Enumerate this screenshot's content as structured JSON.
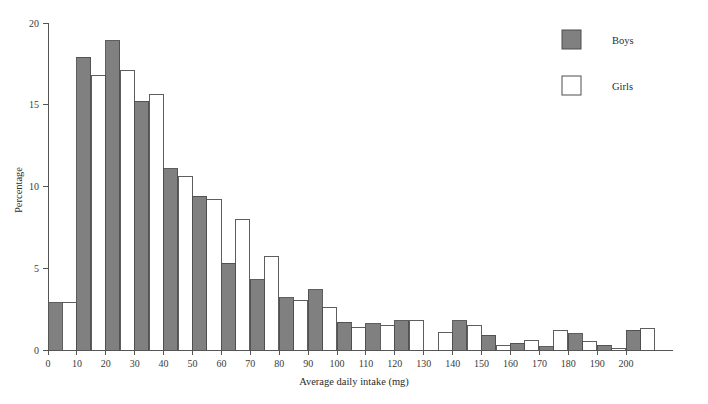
{
  "chart_data": {
    "type": "bar",
    "title": "",
    "xlabel": "Average daily intake (mg)",
    "ylabel": "Percentage",
    "xlim": [
      0,
      210
    ],
    "ylim": [
      0,
      20
    ],
    "xticks": [
      0,
      10,
      20,
      30,
      40,
      50,
      60,
      70,
      80,
      90,
      100,
      110,
      120,
      130,
      140,
      150,
      160,
      170,
      180,
      190,
      200
    ],
    "yticks": [
      0,
      5,
      10,
      15,
      20
    ],
    "grid": false,
    "legend_position": "top-right",
    "bin_width": 10,
    "bin_starts": [
      0,
      10,
      20,
      30,
      40,
      50,
      60,
      70,
      80,
      90,
      100,
      110,
      120,
      130,
      140,
      150,
      160,
      170,
      180,
      190,
      200
    ],
    "categories": [
      "0-10",
      "10-20",
      "20-30",
      "30-40",
      "40-50",
      "50-60",
      "60-70",
      "70-80",
      "80-90",
      "90-100",
      "100-110",
      "110-120",
      "120-130",
      "130-140",
      "140-150",
      "150-160",
      "160-170",
      "170-180",
      "180-190",
      "190-200",
      "200-210"
    ],
    "series": [
      {
        "name": "Boys",
        "color": "#808080",
        "edge_color": "#4d4d4d",
        "values": [
          2.9,
          17.9,
          18.9,
          15.2,
          11.1,
          9.4,
          5.3,
          4.3,
          3.2,
          3.7,
          1.7,
          1.6,
          1.8,
          0.0,
          1.8,
          0.9,
          0.4,
          0.2,
          1.0,
          0.3,
          1.2
        ]
      },
      {
        "name": "Girls",
        "color": "#ffffff",
        "edge_color": "#4d4d4d",
        "values": [
          2.9,
          16.8,
          17.1,
          15.6,
          10.6,
          9.2,
          8.0,
          5.7,
          3.0,
          2.6,
          1.4,
          1.5,
          1.8,
          1.1,
          1.5,
          0.3,
          0.6,
          1.2,
          0.5,
          0.1,
          1.3
        ]
      }
    ]
  },
  "legend": {
    "entries": [
      {
        "label": "Boys",
        "swatch": "filled-gray-square"
      },
      {
        "label": "Girls",
        "swatch": "open-white-square"
      }
    ]
  },
  "axes": {
    "y_title": "Percentage",
    "x_title": "Average daily intake (mg)",
    "y_tick_labels": [
      "0",
      "5",
      "10",
      "15",
      "20"
    ],
    "x_tick_labels": [
      "0",
      "10",
      "20",
      "30",
      "40",
      "50",
      "60",
      "70",
      "80",
      "90",
      "100",
      "110",
      "120",
      "130",
      "140",
      "150",
      "160",
      "170",
      "180",
      "190",
      "200"
    ]
  },
  "colors": {
    "boys_fill": "#808080",
    "girls_fill": "#ffffff",
    "bar_edge": "#4d4d4d",
    "axis": "#555555",
    "text": "#2b2b2b",
    "background": "#ffffff"
  }
}
